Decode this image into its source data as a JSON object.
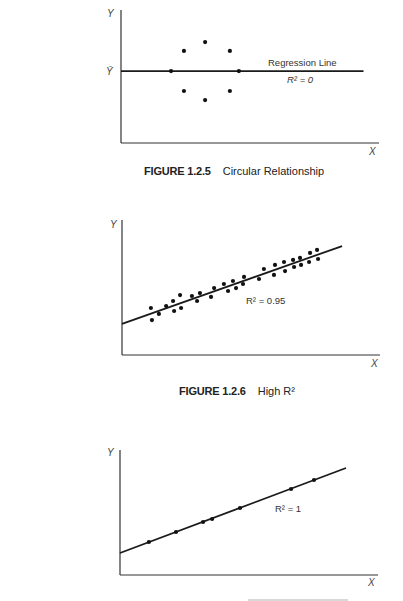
{
  "chart_data": [
    {
      "type": "scatter",
      "figure_number": "FIGURE 1.2.5",
      "title": "Circular Relationship",
      "xlabel": "X",
      "ylabel": "Y",
      "y_reference_label": "Ȳ",
      "xlim": [
        0,
        100
      ],
      "ylim": [
        0,
        100
      ],
      "grid": false,
      "points": [
        {
          "x": 19.4,
          "y": 54.1
        },
        {
          "x": 24.4,
          "y": 69.2
        },
        {
          "x": 32.6,
          "y": 75.9
        },
        {
          "x": 42.2,
          "y": 69.2
        },
        {
          "x": 45.7,
          "y": 54.1
        },
        {
          "x": 24.4,
          "y": 39.1
        },
        {
          "x": 32.6,
          "y": 32.3
        },
        {
          "x": 42.2,
          "y": 39.1
        }
      ],
      "regression_line": {
        "x": [
          0,
          94
        ],
        "y": [
          54.1,
          54.1
        ]
      },
      "annotations": [
        "Regression Line",
        "R² = 0"
      ],
      "r_squared": 0
    },
    {
      "type": "scatter",
      "figure_number": "FIGURE 1.2.6",
      "title": "High R²",
      "xlabel": "X",
      "ylabel": "Y",
      "xlim": [
        0,
        100
      ],
      "ylim": [
        0,
        100
      ],
      "grid": false,
      "points": [
        {
          "x": 11.2,
          "y": 34.8
        },
        {
          "x": 11.6,
          "y": 25.9
        },
        {
          "x": 14.3,
          "y": 30.4
        },
        {
          "x": 17.1,
          "y": 36.3
        },
        {
          "x": 19.8,
          "y": 40.0
        },
        {
          "x": 20.2,
          "y": 32.6
        },
        {
          "x": 22.5,
          "y": 44.4
        },
        {
          "x": 22.9,
          "y": 34.8
        },
        {
          "x": 27.1,
          "y": 43.7
        },
        {
          "x": 29.1,
          "y": 40.0
        },
        {
          "x": 30.2,
          "y": 45.9
        },
        {
          "x": 34.5,
          "y": 43.0
        },
        {
          "x": 35.7,
          "y": 49.6
        },
        {
          "x": 39.5,
          "y": 52.6
        },
        {
          "x": 41.1,
          "y": 47.4
        },
        {
          "x": 43.0,
          "y": 54.8
        },
        {
          "x": 44.2,
          "y": 49.6
        },
        {
          "x": 47.3,
          "y": 57.8
        },
        {
          "x": 46.9,
          "y": 52.6
        },
        {
          "x": 53.1,
          "y": 56.3
        },
        {
          "x": 55.0,
          "y": 63.7
        },
        {
          "x": 58.9,
          "y": 59.3
        },
        {
          "x": 59.3,
          "y": 66.7
        },
        {
          "x": 62.8,
          "y": 68.9
        },
        {
          "x": 63.2,
          "y": 62.2
        },
        {
          "x": 66.3,
          "y": 70.4
        },
        {
          "x": 66.7,
          "y": 65.2
        },
        {
          "x": 69.0,
          "y": 71.9
        },
        {
          "x": 69.4,
          "y": 66.7
        },
        {
          "x": 72.5,
          "y": 68.9
        },
        {
          "x": 72.9,
          "y": 75.6
        },
        {
          "x": 75.6,
          "y": 77.8
        },
        {
          "x": 76.0,
          "y": 71.1
        }
      ],
      "regression_line": {
        "x": [
          0,
          85.3
        ],
        "y": [
          23.0,
          80.7
        ]
      },
      "annotations": [
        "R² = 0.95"
      ],
      "r_squared": 0.95
    },
    {
      "type": "scatter",
      "figure_number": "",
      "title": "",
      "xlabel": "X",
      "ylabel": "Y",
      "xlim": [
        0,
        100
      ],
      "ylim": [
        0,
        100
      ],
      "grid": false,
      "points": [
        {
          "x": 11.2,
          "y": 26.4
        },
        {
          "x": 21.7,
          "y": 34.4
        },
        {
          "x": 32.2,
          "y": 42.4
        },
        {
          "x": 35.7,
          "y": 44.8
        },
        {
          "x": 46.5,
          "y": 53.6
        },
        {
          "x": 66.3,
          "y": 68.8
        },
        {
          "x": 75.2,
          "y": 76.0
        }
      ],
      "regression_line": {
        "x": [
          0,
          87.6
        ],
        "y": [
          17.6,
          85.6
        ]
      },
      "annotations": [
        "R² = 1"
      ],
      "r_squared": 1
    }
  ]
}
